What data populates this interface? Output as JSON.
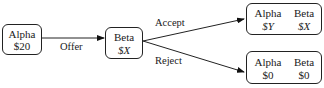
{
  "diagram": {
    "type": "game-tree",
    "nodes": [
      {
        "id": "alpha",
        "label": "Alpha",
        "value": "$20"
      },
      {
        "id": "beta",
        "label": "Beta",
        "value": "$X"
      },
      {
        "id": "accept_outcome",
        "players": [
          {
            "label": "Alpha",
            "value": "$Y"
          },
          {
            "label": "Beta",
            "value": "$X"
          }
        ]
      },
      {
        "id": "reject_outcome",
        "players": [
          {
            "label": "Alpha",
            "value": "$0"
          },
          {
            "label": "Beta",
            "value": "$0"
          }
        ]
      }
    ],
    "edges": [
      {
        "from": "alpha",
        "to": "beta",
        "label": "Offer"
      },
      {
        "from": "beta",
        "to": "accept_outcome",
        "label": "Accept"
      },
      {
        "from": "beta",
        "to": "reject_outcome",
        "label": "Reject"
      }
    ]
  }
}
